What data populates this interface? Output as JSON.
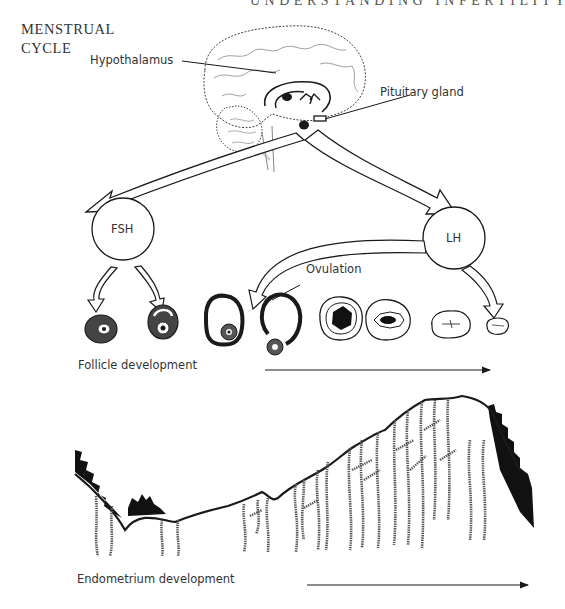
{
  "page": {
    "running_head": "UNDERSTANDING INFERTILITY",
    "section_title_line1": "MENSTRUAL",
    "section_title_line2": "CYCLE"
  },
  "diagram": {
    "labels": {
      "hypothalamus": "Hypothalamus",
      "pituitary": "Pituitary gland",
      "fsh": "FSH",
      "lh": "LH",
      "ovulation": "Ovulation",
      "follicle_development": "Follicle development",
      "endometrium_development": "Endometrium development"
    },
    "follicle_stages": [
      "primary-follicle",
      "secondary-follicle",
      "mature-follicle",
      "ruptured-follicle-releasing-egg",
      "corpus-luteum-early",
      "corpus-luteum",
      "corpus-albicans",
      "regressed-corpus"
    ],
    "colors": {
      "ink": "#1a1a1a",
      "paper": "#ffffff",
      "fill_dark": "#111111"
    }
  }
}
